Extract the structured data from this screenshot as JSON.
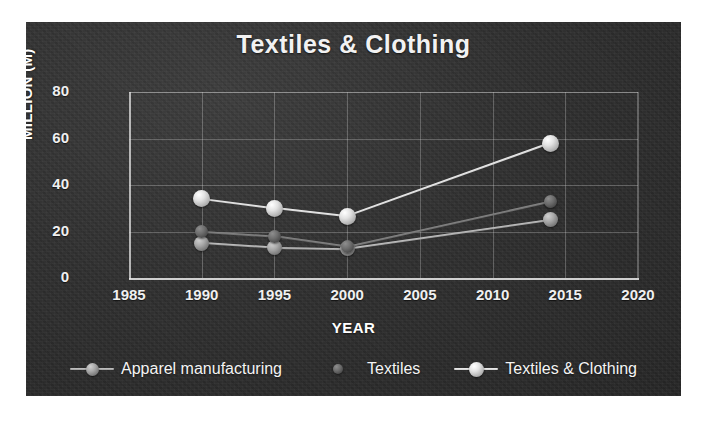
{
  "chart_data": {
    "type": "line",
    "title": "Textiles & Clothing",
    "xlabel": "YEAR",
    "ylabel": "MILLION (M)",
    "xlim": [
      1985,
      2020
    ],
    "ylim": [
      0,
      80
    ],
    "xticks": [
      "1985",
      "1990",
      "1995",
      "2000",
      "2005",
      "2010",
      "2015",
      "2020"
    ],
    "yticks": [
      "0",
      "20",
      "40",
      "60",
      "80"
    ],
    "grid": true,
    "legend_position": "bottom",
    "x": [
      1990,
      1995,
      2000,
      2014
    ],
    "series": [
      {
        "name": "Apparel manufacturing",
        "values": [
          15,
          13,
          12.5,
          25
        ],
        "marker": "sphere-mid",
        "color": "#a8a8a8"
      },
      {
        "name": "Textiles",
        "values": [
          20,
          18,
          13.5,
          33
        ],
        "marker": "sphere-dark",
        "color": "#6e6e6e"
      },
      {
        "name": "Textiles & Clothing",
        "values": [
          34,
          30,
          26.5,
          58
        ],
        "marker": "sphere-light",
        "color": "#e2e2e2"
      }
    ]
  },
  "legend": {
    "items": [
      {
        "label": "Apparel manufacturing",
        "key": "legend-marker-apparel"
      },
      {
        "label": "Textiles",
        "key": "legend-marker-textiles"
      },
      {
        "label": "Textiles & Clothing",
        "key": "legend-marker-textiles-clothing"
      }
    ]
  },
  "colors": {
    "panel_background": "#303030",
    "text": "#f2f2f2",
    "grid": "#d7d7d7",
    "page_background": "#ffffff"
  }
}
